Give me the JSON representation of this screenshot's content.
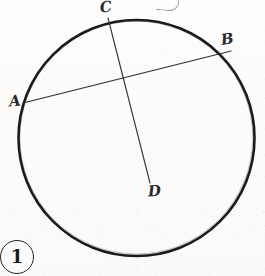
{
  "figure": {
    "number_label": "1",
    "caption": "",
    "width": 265,
    "height": 276,
    "background_color": "#fdfcfb",
    "ink_color": "#1b1b1d"
  },
  "geometry": {
    "circle": {
      "name": "main-circle",
      "center_x": 136.5,
      "center_y": 138,
      "radius": 118,
      "stroke_width": 2.6,
      "stroke_color": "#1b1b1d",
      "fill": "none"
    },
    "chords": [
      {
        "name": "chord-AB",
        "from": "A",
        "to": "B",
        "x1": 23,
        "y1": 103,
        "x2": 231,
        "y2": 51,
        "stroke_width": 1.1,
        "stroke_color": "#303033"
      },
      {
        "name": "segment-CD",
        "from": "C",
        "to": "D",
        "x1": 108,
        "y1": 18,
        "x2": 150,
        "y2": 183,
        "stroke_width": 1.1,
        "stroke_color": "#303033"
      }
    ],
    "intersection": {
      "name": "intersection-point",
      "x": 126,
      "y": 77
    },
    "points": [
      {
        "id": "A",
        "label": "A",
        "x": 23,
        "y": 103,
        "on_circle": true,
        "label_x": 9,
        "label_y": 94
      },
      {
        "id": "B",
        "label": "B",
        "x": 231,
        "y": 51,
        "on_circle": true,
        "label_x": 221,
        "label_y": 32
      },
      {
        "id": "C",
        "label": "C",
        "x": 108,
        "y": 18,
        "on_circle": true,
        "label_x": 100,
        "label_y": 0
      },
      {
        "id": "D",
        "label": "D",
        "x": 150,
        "y": 183,
        "on_circle": false,
        "label_x": 148,
        "label_y": 184
      }
    ]
  },
  "marks": {
    "stray_top_mark": "partial-cut-off-stroke"
  }
}
